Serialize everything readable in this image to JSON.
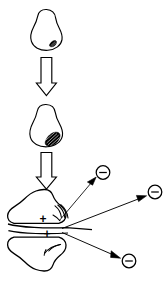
{
  "figure": {
    "title": "Stage progression diagram",
    "background_color": "#ffffff",
    "stroke_color": "#000000",
    "fill_color": "#ffffff",
    "width": 167,
    "height": 284,
    "orientation": "vertical top-to-bottom flow"
  },
  "stages": [
    {
      "id": "stage-1",
      "name": "early-lesion-blob",
      "shape": "pear-shaped outline blob",
      "center_x": 46,
      "center_y": 30,
      "width": 34,
      "height": 42,
      "marking": {
        "name": "small-hatched-patch",
        "description": "small solid/hatched patch at lower-right interior",
        "x": 52,
        "y": 41,
        "size": "small"
      }
    },
    {
      "id": "stage-2",
      "name": "enlarged-lesion-blob",
      "shape": "pear-shaped outline blob",
      "center_x": 46,
      "center_y": 126,
      "width": 36,
      "height": 44,
      "marking": {
        "name": "large-hatched-patch",
        "description": "enlarged hatched/striped patch at lower-right interior",
        "x": 52,
        "y": 139,
        "size": "large"
      }
    },
    {
      "id": "stage-3",
      "name": "invasive-bilobed-mass",
      "shape": "two mirrored amoeboid lobes joined at a horizontal midline",
      "center_x": 50,
      "center_y": 230,
      "width": 82,
      "height": 88
    }
  ],
  "arrows": [
    {
      "name": "progression-arrow-1",
      "style": "hollow-outline-block-arrow",
      "direction": "down",
      "x": 46,
      "y_start": 57,
      "y_end": 94
    },
    {
      "name": "progression-arrow-2",
      "style": "hollow-outline-block-arrow",
      "direction": "down",
      "x": 46,
      "y_start": 152,
      "y_end": 188
    }
  ],
  "emission_arrows": [
    {
      "name": "emission-arrow-upper",
      "style": "thin-line-solid-head",
      "from_x": 60,
      "from_y": 220,
      "to_x": 96,
      "to_y": 179
    },
    {
      "name": "emission-arrow-middle",
      "style": "thin-line-solid-head",
      "from_x": 62,
      "from_y": 226,
      "to_x": 147,
      "to_y": 196
    },
    {
      "name": "emission-arrow-lower",
      "style": "thin-line-solid-head",
      "from_x": 62,
      "from_y": 232,
      "to_x": 121,
      "to_y": 260
    }
  ],
  "charge_labels": {
    "positive": [
      {
        "name": "positive-charge-upper-lobe",
        "symbol": "+",
        "x": 43,
        "y": 219
      },
      {
        "name": "positive-charge-lower-lobe",
        "symbol": "+",
        "x": 47,
        "y": 234
      }
    ],
    "negative": [
      {
        "name": "negative-charge-upper",
        "symbol": "⊖",
        "x": 103,
        "y": 173,
        "radius": 7
      },
      {
        "name": "negative-charge-right",
        "symbol": "⊖",
        "x": 155,
        "y": 192,
        "radius": 7
      },
      {
        "name": "negative-charge-lower",
        "symbol": "⊖",
        "x": 129,
        "y": 261,
        "radius": 7
      }
    ]
  },
  "hatch_marks": [
    {
      "name": "hatch-marks-upper-lobe",
      "description": "three short curved emanating strokes near right edge of upper lobe",
      "x": 58,
      "y": 212
    },
    {
      "name": "hatch-marks-lower-lobe",
      "description": "short curved strokes near right edge of lower lobe",
      "x": 52,
      "y": 245
    }
  ]
}
